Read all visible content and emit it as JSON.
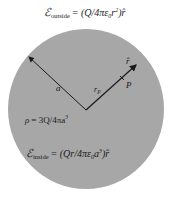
{
  "diagram": {
    "colors": {
      "sphere": "#a7a7a7",
      "background": "#ffffff",
      "ink": "#1a1a1a"
    },
    "equations": {
      "outside": {
        "symbol": "ℰ",
        "subscript": "outside",
        "rhs": "= (Q/4πε",
        "eps_sub": "0",
        "r": "r",
        "pow": "2",
        "tail": ")r̂"
      },
      "inside": {
        "symbol": "ℰ",
        "subscript": "inside",
        "rhs": "= (Qr/4πε",
        "eps_sub": "0",
        "a": "a",
        "pow": "3",
        "tail": ")r̂"
      },
      "density": {
        "lhs": "ρ",
        "rhs": "= 3Q/4πa",
        "pow": "3"
      }
    },
    "labels": {
      "radius": "a",
      "position_vector": "r",
      "position_sub": "P",
      "unit_vector": "r̂",
      "point": "P"
    }
  }
}
